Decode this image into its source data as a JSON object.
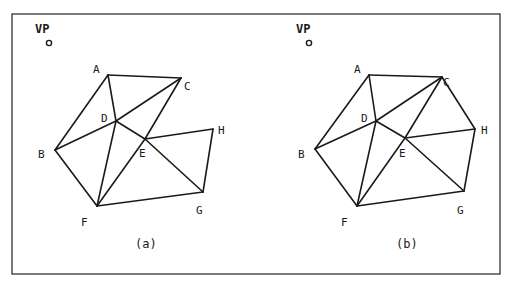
{
  "figure": {
    "frame": {
      "x": 12,
      "y": 14,
      "w": 488,
      "h": 260,
      "color": "#333333"
    },
    "panels": [
      {
        "id": "a",
        "caption": "(a)",
        "caption_pos": [
          135,
          248
        ],
        "vp": {
          "label": "VP",
          "label_pos": [
            35,
            33
          ],
          "dot": [
            49,
            43
          ]
        },
        "vertices": {
          "A": [
            108,
            75
          ],
          "B": [
            55,
            150
          ],
          "C": [
            181,
            78
          ],
          "D": [
            116,
            121
          ],
          "E": [
            145,
            139
          ],
          "F": [
            97,
            206
          ],
          "G": [
            203,
            192
          ],
          "H": [
            213,
            129
          ]
        },
        "label_pos": {
          "A": [
            93,
            73
          ],
          "B": [
            38,
            158
          ],
          "C": [
            184,
            90
          ],
          "D": [
            101,
            122
          ],
          "E": [
            139,
            157
          ],
          "F": [
            81,
            226
          ],
          "G": [
            196,
            214
          ],
          "H": [
            218,
            134
          ]
        },
        "edges": [
          [
            "A",
            "C"
          ],
          [
            "A",
            "B"
          ],
          [
            "A",
            "D"
          ],
          [
            "B",
            "D"
          ],
          [
            "D",
            "C"
          ],
          [
            "C",
            "E"
          ],
          [
            "B",
            "F"
          ],
          [
            "D",
            "F"
          ],
          [
            "F",
            "E"
          ],
          [
            "D",
            "E"
          ],
          [
            "E",
            "G"
          ],
          [
            "E",
            "H"
          ],
          [
            "H",
            "G"
          ],
          [
            "F",
            "G"
          ]
        ]
      },
      {
        "id": "b",
        "caption": "(b)",
        "caption_pos": [
          396,
          248
        ],
        "vp": {
          "label": "VP",
          "label_pos": [
            296,
            33
          ],
          "dot": [
            309,
            43
          ]
        },
        "vertices": {
          "A": [
            369,
            75
          ],
          "B": [
            315,
            149
          ],
          "C": [
            442,
            77
          ],
          "D": [
            376,
            121
          ],
          "E": [
            405,
            138
          ],
          "F": [
            357,
            206
          ],
          "G": [
            464,
            191
          ],
          "H": [
            475,
            129
          ]
        },
        "label_pos": {
          "A": [
            354,
            73
          ],
          "B": [
            298,
            158
          ],
          "C": [
            443,
            86
          ],
          "D": [
            361,
            122
          ],
          "E": [
            399,
            157
          ],
          "F": [
            341,
            226
          ],
          "G": [
            457,
            214
          ],
          "H": [
            481,
            134
          ]
        },
        "edges": [
          [
            "A",
            "C"
          ],
          [
            "A",
            "B"
          ],
          [
            "A",
            "D"
          ],
          [
            "B",
            "D"
          ],
          [
            "D",
            "C"
          ],
          [
            "C",
            "E"
          ],
          [
            "C",
            "H"
          ],
          [
            "B",
            "F"
          ],
          [
            "D",
            "F"
          ],
          [
            "F",
            "E"
          ],
          [
            "D",
            "E"
          ],
          [
            "E",
            "G"
          ],
          [
            "E",
            "H"
          ],
          [
            "H",
            "G"
          ],
          [
            "F",
            "G"
          ]
        ]
      }
    ]
  }
}
